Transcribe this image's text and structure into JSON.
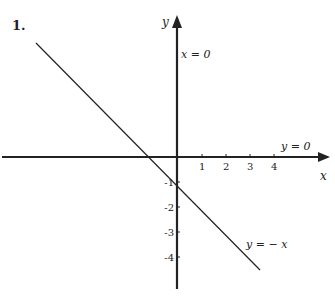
{
  "problem_number": "1.",
  "axes": {
    "x_label": "x",
    "y_label": "y",
    "x_ticks": [
      "1",
      "2",
      "3",
      "4"
    ],
    "y_ticks": [
      "-1",
      "-2",
      "-3",
      "-4"
    ]
  },
  "annotations": {
    "y_axis_eq": "x = 0",
    "x_axis_eq": "y = 0",
    "line_eq": "y = − x"
  },
  "colors": {
    "ink": "#222222",
    "background": "#ffffff"
  }
}
